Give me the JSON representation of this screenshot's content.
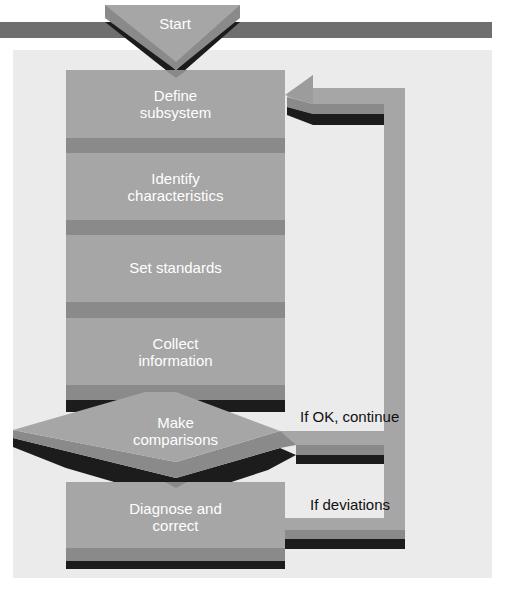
{
  "diagram": {
    "start": {
      "label": "Start"
    },
    "steps": [
      {
        "id": "define",
        "line1": "Define",
        "line2": "subsystem"
      },
      {
        "id": "identify",
        "line1": "Identify",
        "line2": "characteristics"
      },
      {
        "id": "standards",
        "line1": "Set standards",
        "line2": ""
      },
      {
        "id": "collect",
        "line1": "Collect",
        "line2": "information"
      }
    ],
    "decision": {
      "line1": "Make",
      "line2": "comparisons"
    },
    "correct": {
      "line1": "Diagnose and",
      "line2": "correct"
    },
    "notes": {
      "ok": "If OK, continue",
      "deviations": "If deviations"
    },
    "colors": {
      "box": "#a6a6a6",
      "band": "#8a8a8a",
      "shadow": "#1c1c1c",
      "background": "#ebebeb",
      "topbar": "#6f6f6f"
    }
  }
}
